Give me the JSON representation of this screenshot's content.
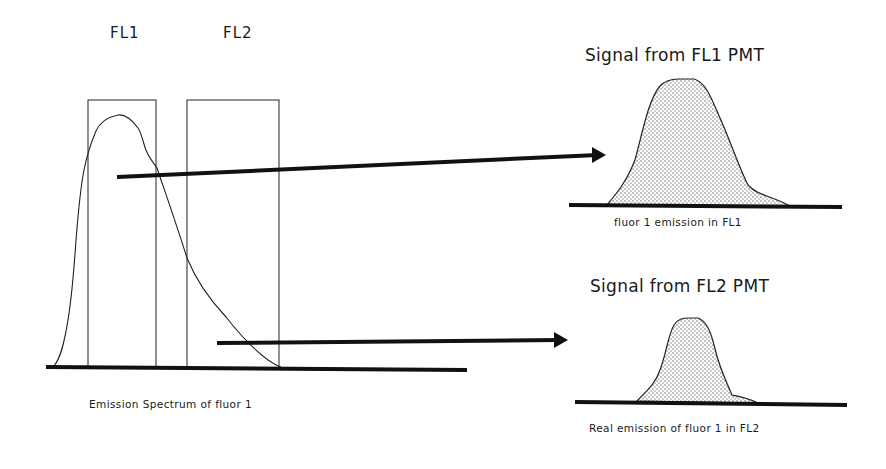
{
  "filters": {
    "fl1_label": "FL1",
    "fl2_label": "FL2"
  },
  "spectrum": {
    "caption": "Emission Spectrum of fluor 1"
  },
  "signal_fl1": {
    "title": "Signal from FL1 PMT",
    "caption": "fluor 1 emission in FL1"
  },
  "signal_fl2": {
    "title": "Signal from FL2 PMT",
    "caption": "Real emission of fluor 1 in FL2"
  },
  "colors": {
    "ink": "#111111",
    "fill_stipple": "#d9d9d9",
    "background": "#ffffff"
  }
}
